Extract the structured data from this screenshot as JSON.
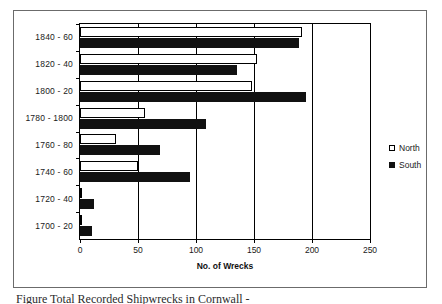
{
  "chart_data": {
    "type": "bar",
    "orientation": "horizontal",
    "title": "",
    "xlabel": "No. of Wrecks",
    "ylabel": "",
    "xlim": [
      0,
      250
    ],
    "xticks": [
      0,
      50,
      100,
      150,
      200,
      250
    ],
    "grid": true,
    "legend_position": "right",
    "categories": [
      "1700 - 20",
      "1720 - 40",
      "1740 - 60",
      "1760 - 80",
      "1780 - 1800",
      "1800 - 20",
      "1820 - 40",
      "1840 - 60"
    ],
    "series": [
      {
        "name": "North",
        "color": "#ffffff",
        "values": [
          2,
          2,
          50,
          31,
          56,
          148,
          153,
          191
        ]
      },
      {
        "name": "South",
        "color": "#111111",
        "values": [
          10,
          12,
          95,
          69,
          109,
          195,
          135,
          189
        ]
      }
    ]
  },
  "legend": {
    "items": [
      {
        "label": "North",
        "swatch": "hollow-square-icon"
      },
      {
        "label": "South",
        "swatch": "filled-square-icon"
      }
    ]
  },
  "caption": {
    "text": "Figure     Total Recorded Shipwrecks in Cornwall          -"
  }
}
